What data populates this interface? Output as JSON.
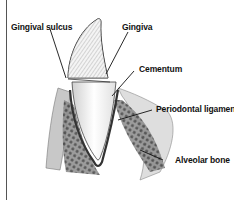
{
  "diagram": {
    "labels": [
      {
        "id": "gingival-sulcus",
        "text": "Gingival sulcus"
      },
      {
        "id": "gingiva",
        "text": "Gingiva"
      },
      {
        "id": "cementum",
        "text": "Cementum"
      },
      {
        "id": "periodontal-ligament",
        "text": "Periodontal ligament"
      },
      {
        "id": "alveolar-bone",
        "text": "Alveolar bone"
      }
    ],
    "colors": {
      "ink": "#111111",
      "enamel": "#d9d9d9",
      "root": "#f2f2f2",
      "bone": "#6b6b6b",
      "gum": "#c8c8c8"
    }
  }
}
